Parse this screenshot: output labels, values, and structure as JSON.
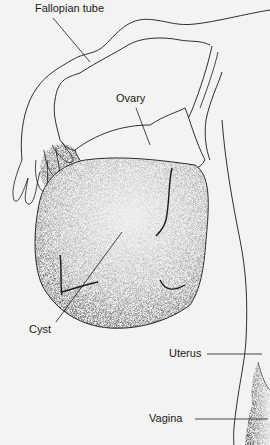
{
  "figure": {
    "background_color": "#f3f3f1",
    "ink_color": "#1a1a1a",
    "labels": {
      "fallopian_tube": "Fallopian tube",
      "ovary": "Ovary",
      "cyst": "Cyst",
      "uterus": "Uterus",
      "vagina": "Vagina"
    }
  }
}
